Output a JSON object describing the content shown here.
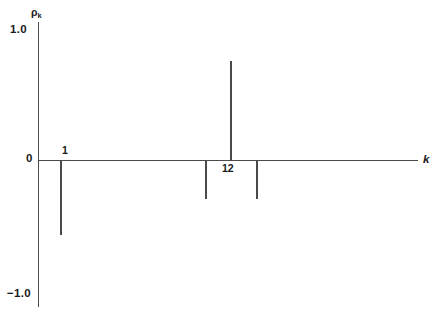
{
  "chart_data": {
    "type": "bar",
    "title": "",
    "subtitle": "",
    "xlabel": "k",
    "ylabel": "ρ",
    "ylabel_sub": "k",
    "ylim": [
      -1.0,
      1.0
    ],
    "grid": false,
    "legend": null,
    "y_tick_labels": [
      "1.0",
      "0",
      "−1.0"
    ],
    "y_tick_values": [
      1.0,
      0,
      -1.0
    ],
    "x_annotations": [
      {
        "label": "1",
        "k": 1,
        "position": "above-axis"
      },
      {
        "label": "12",
        "k": 12,
        "position": "below-axis"
      }
    ],
    "categories": [
      1,
      11,
      12,
      13
    ],
    "values": [
      -0.58,
      -0.3,
      0.76,
      -0.3
    ],
    "series": [
      {
        "name": "autocorrelation",
        "points": [
          {
            "k": 1,
            "rho": -0.58
          },
          {
            "k": 11,
            "rho": -0.3
          },
          {
            "k": 12,
            "rho": 0.76
          },
          {
            "k": 13,
            "rho": -0.3
          }
        ]
      }
    ]
  },
  "layout": {
    "width": 442,
    "height": 317,
    "axis_color": "#4a4a4a",
    "text_color": "#1a1a1a",
    "background": "#ffffff",
    "y_axis_x": 38,
    "baseline_y": 160,
    "y_top_px": 30,
    "y_bottom_px": 294,
    "x_axis_end": 418,
    "spike_x": [
      61,
      206,
      231,
      257
    ]
  }
}
